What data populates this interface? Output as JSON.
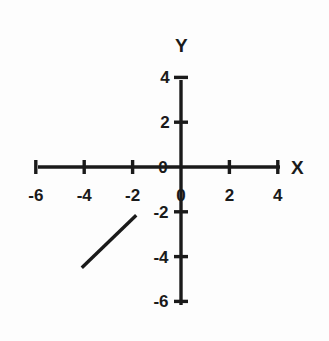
{
  "chart_data": {
    "type": "line",
    "title": "",
    "xlabel": "X",
    "ylabel": "Y",
    "xlim": [
      -6,
      4
    ],
    "ylim": [
      -6,
      4
    ],
    "grid": false,
    "legend": "none",
    "x_ticks": [
      -6,
      -4,
      -2,
      0,
      2,
      4
    ],
    "y_ticks": [
      4,
      2,
      0,
      -2,
      -4,
      -6
    ],
    "x_tick_labels": [
      "-6",
      "-4",
      "-2",
      "0",
      "2",
      "4"
    ],
    "y_tick_labels": [
      "4",
      "2",
      "0",
      "-2",
      "-4",
      "-6"
    ],
    "origin_label": "0",
    "series": [
      {
        "name": "segment",
        "type": "line-segment",
        "x": [
          -4.1,
          -1.85
        ],
        "y": [
          -4.5,
          -2.15
        ],
        "color": "#1a1a1a"
      }
    ]
  },
  "axis_labels": {
    "x": "X",
    "y": "Y"
  },
  "colors": {
    "axis": "#1a1a1a",
    "line": "#1a1a1a",
    "background": "#fdfdfd",
    "text": "#1a1a1a"
  },
  "geometry": {
    "origin_x": 181,
    "origin_y": 167,
    "unit_x": 24.2,
    "unit_y": 22.4,
    "x_axis_start": 38,
    "x_axis_end": 280,
    "y_axis_top": 80,
    "y_axis_bottom": 305,
    "tick_half": 7,
    "axis_width": 3.4,
    "line_width": 3.4
  }
}
